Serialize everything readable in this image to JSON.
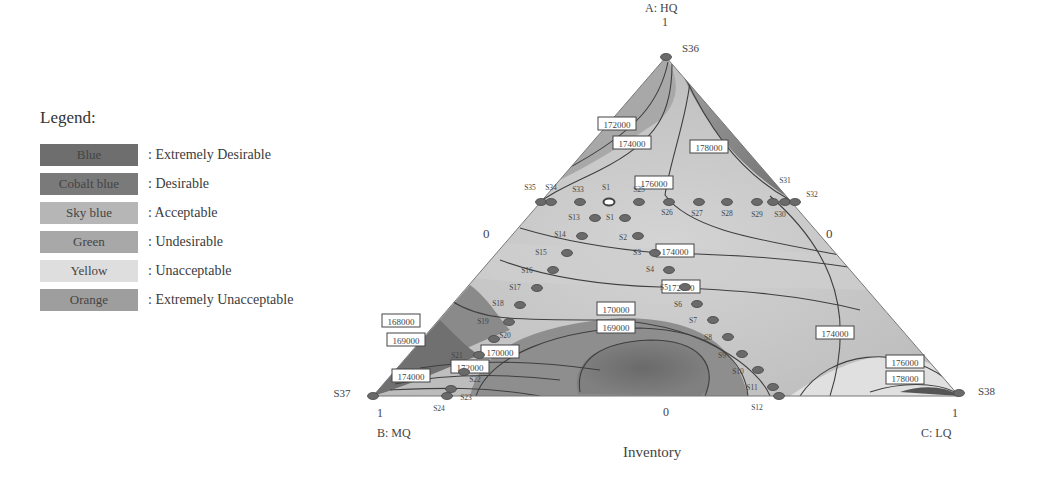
{
  "legend": {
    "title": "Legend:",
    "items": [
      {
        "swatch": "Blue",
        "meaning": ": Extremely Desirable",
        "color": "#6e6e6e"
      },
      {
        "swatch": "Cobalt blue",
        "meaning": ": Desirable",
        "color": "#7a7a7a"
      },
      {
        "swatch": "Sky blue",
        "meaning": ": Acceptable",
        "color": "#b4b4b4"
      },
      {
        "swatch": "Green",
        "meaning": ": Undesirable",
        "color": "#a6a6a6"
      },
      {
        "swatch": "Yellow",
        "meaning": ": Unacceptable",
        "color": "#dcdcdc"
      },
      {
        "swatch": "Orange",
        "meaning": ": Extremely Unacceptable",
        "color": "#9c9c9c"
      }
    ]
  },
  "axes": {
    "a_label": "A: HQ",
    "a_tick": "1",
    "b_label": "B: MQ",
    "b_tick": "1",
    "c_label": "C: LQ",
    "c_tick": "1",
    "left_zero": "0",
    "right_zero": "0",
    "bottom_zero": "0",
    "title": "Inventory"
  },
  "chart_data": {
    "type": "ternary-contour",
    "title": "Inventory",
    "vertices": {
      "A": "HQ",
      "B": "MQ",
      "C": "LQ"
    },
    "axis_labels": [
      "A: HQ",
      "B: MQ",
      "C: LQ"
    ],
    "contour_labels": [
      "168000",
      "169000",
      "169000",
      "170000",
      "170000",
      "172000",
      "172000",
      "172000",
      "174000",
      "174000",
      "174000",
      "174000",
      "176000",
      "176000",
      "178000",
      "178000"
    ],
    "contour_levels": [
      168000,
      169000,
      170000,
      172000,
      174000,
      176000,
      178000
    ],
    "design_points": [
      "S1",
      "S2",
      "S3",
      "S4",
      "S5",
      "S6",
      "S7",
      "S8",
      "S9",
      "S10",
      "S11",
      "S12",
      "S13",
      "S14",
      "S15",
      "S16",
      "S17",
      "S18",
      "S19",
      "S20",
      "S21",
      "S22",
      "S23",
      "S24",
      "S25",
      "S26",
      "S27",
      "S28",
      "S29",
      "S30",
      "S31",
      "S32",
      "S33",
      "S34",
      "S35",
      "S36",
      "S37",
      "S38"
    ],
    "vertex_points": {
      "A": "S36",
      "B": "S37",
      "C": "S38"
    },
    "minimum_region": "169000 (center-bottom)",
    "maximum_region": "178000 (near C: LQ and upper-right of A)"
  },
  "contour_boxes": [
    {
      "label": "172000",
      "x": 617,
      "y": 124
    },
    {
      "label": "174000",
      "x": 632,
      "y": 143
    },
    {
      "label": "178000",
      "x": 709,
      "y": 147
    },
    {
      "label": "176000",
      "x": 654,
      "y": 183
    },
    {
      "label": "174000",
      "x": 675,
      "y": 251
    },
    {
      "label": "172000",
      "x": 681,
      "y": 287
    },
    {
      "label": "170000",
      "x": 616,
      "y": 309
    },
    {
      "label": "169000",
      "x": 616,
      "y": 327
    },
    {
      "label": "168000",
      "x": 401,
      "y": 321
    },
    {
      "label": "169000",
      "x": 406,
      "y": 340
    },
    {
      "label": "170000",
      "x": 500,
      "y": 352
    },
    {
      "label": "172000",
      "x": 470,
      "y": 367
    },
    {
      "label": "174000",
      "x": 411,
      "y": 376
    },
    {
      "label": "174000",
      "x": 835,
      "y": 333
    },
    {
      "label": "176000",
      "x": 905,
      "y": 362
    },
    {
      "label": "178000",
      "x": 905,
      "y": 378
    }
  ],
  "points": [
    {
      "id": "S36",
      "x": 666,
      "y": 57,
      "lx": 682,
      "ly": 52
    },
    {
      "id": "S35",
      "x": 541,
      "y": 202,
      "lx": 530,
      "ly": 190
    },
    {
      "id": "S34",
      "x": 551,
      "y": 202,
      "lx": 551,
      "ly": 190
    },
    {
      "id": "S33",
      "x": 580,
      "y": 202,
      "lx": 578,
      "ly": 192
    },
    {
      "id": "S1",
      "x": 609,
      "y": 202,
      "lx": 606,
      "ly": 190
    },
    {
      "id": "S25",
      "x": 639,
      "y": 202,
      "lx": 639,
      "ly": 192
    },
    {
      "id": "S26",
      "x": 669,
      "y": 202,
      "lx": 667,
      "ly": 215
    },
    {
      "id": "S27",
      "x": 699,
      "y": 202,
      "lx": 697,
      "ly": 216
    },
    {
      "id": "S28",
      "x": 727,
      "y": 202,
      "lx": 727,
      "ly": 216
    },
    {
      "id": "S29",
      "x": 757,
      "y": 202,
      "lx": 757,
      "ly": 217
    },
    {
      "id": "S30",
      "x": 773,
      "y": 202,
      "lx": 780,
      "ly": 217
    },
    {
      "id": "S31",
      "x": 785,
      "y": 202,
      "lx": 785,
      "ly": 183
    },
    {
      "id": "S32",
      "x": 795,
      "y": 202,
      "lx": 812,
      "ly": 197
    },
    {
      "id": "S13",
      "x": 595,
      "y": 218,
      "lx": 574,
      "ly": 220
    },
    {
      "id": "S1",
      "x": 625,
      "y": 218,
      "lx": 610,
      "ly": 220
    },
    {
      "id": "S14",
      "x": 582,
      "y": 236,
      "lx": 560,
      "ly": 237
    },
    {
      "id": "S2",
      "x": 638,
      "y": 236,
      "lx": 623,
      "ly": 240
    },
    {
      "id": "S15",
      "x": 567,
      "y": 253,
      "lx": 541,
      "ly": 255
    },
    {
      "id": "S3",
      "x": 655,
      "y": 253,
      "lx": 637,
      "ly": 255
    },
    {
      "id": "S16",
      "x": 553,
      "y": 270,
      "lx": 527,
      "ly": 273
    },
    {
      "id": "S4",
      "x": 669,
      "y": 270,
      "lx": 650,
      "ly": 272
    },
    {
      "id": "S17",
      "x": 537,
      "y": 288,
      "lx": 515,
      "ly": 290
    },
    {
      "id": "S5",
      "x": 685,
      "y": 287,
      "lx": 664,
      "ly": 290
    },
    {
      "id": "S18",
      "x": 520,
      "y": 305,
      "lx": 498,
      "ly": 306
    },
    {
      "id": "S6",
      "x": 697,
      "y": 304,
      "lx": 678,
      "ly": 307
    },
    {
      "id": "S19",
      "x": 509,
      "y": 322,
      "lx": 483,
      "ly": 324
    },
    {
      "id": "S7",
      "x": 713,
      "y": 320,
      "lx": 693,
      "ly": 323
    },
    {
      "id": "S20",
      "x": 494,
      "y": 339,
      "lx": 505,
      "ly": 338
    },
    {
      "id": "S8",
      "x": 728,
      "y": 337,
      "lx": 708,
      "ly": 340
    },
    {
      "id": "S21",
      "x": 479,
      "y": 355,
      "lx": 457,
      "ly": 358
    },
    {
      "id": "S9",
      "x": 742,
      "y": 354,
      "lx": 722,
      "ly": 358
    },
    {
      "id": "S22",
      "x": 464,
      "y": 372,
      "lx": 475,
      "ly": 382
    },
    {
      "id": "S10",
      "x": 758,
      "y": 370,
      "lx": 738,
      "ly": 374
    },
    {
      "id": "S23",
      "x": 451,
      "y": 389,
      "lx": 466,
      "ly": 400
    },
    {
      "id": "S11",
      "x": 773,
      "y": 387,
      "lx": 752,
      "ly": 390
    },
    {
      "id": "S37",
      "x": 373,
      "y": 396,
      "lx": 342,
      "ly": 397
    },
    {
      "id": "S24",
      "x": 447,
      "y": 396,
      "lx": 439,
      "ly": 411
    },
    {
      "id": "S12",
      "x": 779,
      "y": 396,
      "lx": 757,
      "ly": 410
    },
    {
      "id": "S38",
      "x": 959,
      "y": 393,
      "lx": 978,
      "ly": 395
    }
  ]
}
